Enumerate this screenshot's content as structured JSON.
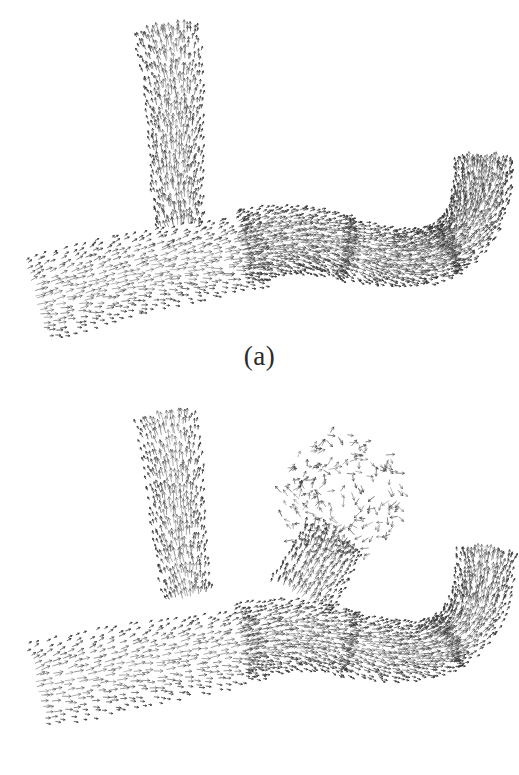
{
  "figure": {
    "background_color": "#ffffff",
    "ink_color": "#333333",
    "width": 519,
    "height": 775
  },
  "panels": [
    {
      "id": "a",
      "caption": "(a)",
      "condition": "healthy-bifurcation",
      "has_aneurysm": false,
      "top": 0
    },
    {
      "id": "b",
      "caption": "(b)",
      "condition": "bifurcation-with-aneurysm",
      "has_aneurysm": true,
      "top": 385
    }
  ],
  "chart_data": {
    "type": "scatter",
    "title": "",
    "subtitle": "",
    "xlabel": "",
    "ylabel": "",
    "grid": false,
    "legend": "none",
    "xlim": [
      0,
      519
    ],
    "ylim": [
      0,
      340
    ],
    "glyph": {
      "name": "arrow-dash",
      "length_px": 7.5,
      "head_px": 2.6,
      "stroke_width": 0.85,
      "color": "#333333"
    },
    "series": [
      {
        "name": "panel-a-vector-field",
        "panel": "a",
        "glyph_count": 2400,
        "seed": 20414,
        "regions": [
          {
            "name": "upper-left-branch",
            "kind": "tube",
            "density": 1.0,
            "width_start": 46,
            "width_end": 62,
            "flow": "outflow-up",
            "path": [
              [
                180,
                226
              ],
              [
                177,
                186
              ],
              [
                176,
                146
              ],
              [
                175,
                106
              ],
              [
                172,
                66
              ],
              [
                166,
                30
              ]
            ]
          },
          {
            "name": "main-trunk-inlet",
            "kind": "tube",
            "density": 1.05,
            "width_start": 86,
            "width_end": 70,
            "flow": "inflow-right",
            "path": [
              [
                36,
                300
              ],
              [
                80,
                288
              ],
              [
                126,
                276
              ],
              [
                172,
                266
              ],
              [
                218,
                258
              ],
              [
                262,
                250
              ]
            ]
          },
          {
            "name": "apex-junction",
            "kind": "tube",
            "density": 1.0,
            "width_start": 72,
            "width_end": 60,
            "flow": "through",
            "path": [
              [
                240,
                246
              ],
              [
                268,
                242
              ],
              [
                296,
                240
              ],
              [
                322,
                242
              ],
              [
                348,
                248
              ]
            ]
          },
          {
            "name": "right-distal-trunk",
            "kind": "tube",
            "density": 1.0,
            "width_start": 60,
            "width_end": 52,
            "flow": "outflow-right",
            "path": [
              [
                340,
                248
              ],
              [
                372,
                254
              ],
              [
                400,
                258
              ],
              [
                426,
                256
              ],
              [
                450,
                248
              ]
            ]
          },
          {
            "name": "right-branch-hook",
            "kind": "tube",
            "density": 1.0,
            "width_start": 52,
            "width_end": 56,
            "flow": "outflow-up",
            "path": [
              [
                440,
                252
              ],
              [
                462,
                236
              ],
              [
                476,
                212
              ],
              [
                482,
                186
              ],
              [
                484,
                160
              ]
            ]
          }
        ]
      },
      {
        "name": "panel-b-vector-field",
        "panel": "b",
        "glyph_count": 2400,
        "seed": 70931,
        "regions": [
          {
            "name": "upper-left-branch",
            "kind": "tube",
            "density": 1.0,
            "width_start": 46,
            "width_end": 60,
            "flow": "outflow-up",
            "path": [
              [
                188,
                212
              ],
              [
                182,
                176
              ],
              [
                178,
                140
              ],
              [
                176,
                104
              ],
              [
                172,
                68
              ],
              [
                166,
                32
              ]
            ]
          },
          {
            "name": "main-trunk-inlet",
            "kind": "tube",
            "density": 1.05,
            "width_start": 88,
            "width_end": 72,
            "flow": "inflow-right",
            "path": [
              [
                36,
                302
              ],
              [
                80,
                292
              ],
              [
                126,
                282
              ],
              [
                172,
                274
              ],
              [
                218,
                266
              ],
              [
                258,
                258
              ]
            ]
          },
          {
            "name": "apex-junction",
            "kind": "tube",
            "density": 1.0,
            "width_start": 74,
            "width_end": 62,
            "flow": "through",
            "path": [
              [
                240,
                256
              ],
              [
                268,
                252
              ],
              [
                296,
                250
              ],
              [
                324,
                252
              ],
              [
                350,
                258
              ]
            ]
          },
          {
            "name": "right-distal-trunk",
            "kind": "tube",
            "density": 1.0,
            "width_start": 62,
            "width_end": 54,
            "flow": "outflow-right",
            "path": [
              [
                342,
                258
              ],
              [
                374,
                264
              ],
              [
                402,
                266
              ],
              [
                428,
                264
              ],
              [
                452,
                256
              ]
            ]
          },
          {
            "name": "right-branch-hook",
            "kind": "tube",
            "density": 1.0,
            "width_start": 54,
            "width_end": 56,
            "flow": "outflow-up",
            "path": [
              [
                442,
                260
              ],
              [
                464,
                244
              ],
              [
                478,
                220
              ],
              [
                484,
                194
              ],
              [
                486,
                168
              ]
            ]
          },
          {
            "name": "aneurysm-dome",
            "kind": "dome",
            "density": 0.3,
            "center": [
              340,
              112
            ],
            "radius_x": 62,
            "radius_y": 66,
            "flow": "recirculating",
            "note": "sparse disorganized low-shear vectors"
          },
          {
            "name": "aneurysm-neck",
            "kind": "tube",
            "density": 0.55,
            "width_start": 66,
            "width_end": 58,
            "flow": "outflow-up",
            "path": [
              [
                300,
                212
              ],
              [
                312,
                192
              ],
              [
                324,
                172
              ],
              [
                334,
                154
              ]
            ]
          }
        ]
      }
    ]
  }
}
